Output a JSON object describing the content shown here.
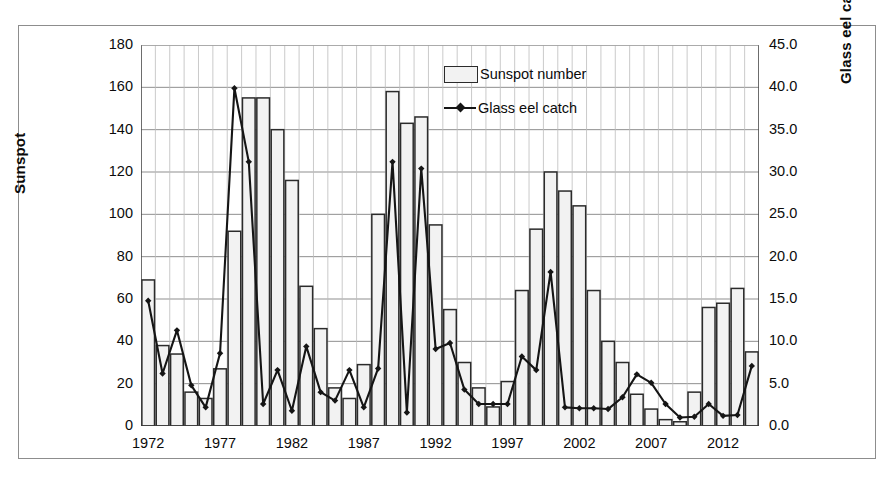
{
  "chart_data": {
    "type": "bar",
    "title": "",
    "subtitle": "",
    "xlabel": "",
    "ylabel": "Sunspot",
    "y2label": "Glass eel catch (tonnes)",
    "grid": true,
    "legend_position": "inside-top-center",
    "xlim": [
      1971.5,
      2014.5
    ],
    "ylim": [
      0,
      180
    ],
    "y2lim": [
      0,
      45
    ],
    "yticks": [
      0,
      20,
      40,
      60,
      80,
      100,
      120,
      140,
      160,
      180
    ],
    "y2ticks": [
      "0.0",
      "5.0",
      "10.0",
      "15.0",
      "20.0",
      "25.0",
      "30.0",
      "35.0",
      "40.0",
      "45.0"
    ],
    "xticks": [
      "1972",
      "1977",
      "1982",
      "1987",
      "1992",
      "1997",
      "2002",
      "2007",
      "2012"
    ],
    "xtick_values": [
      1972,
      1977,
      1982,
      1987,
      1992,
      1997,
      2002,
      2007,
      2012
    ],
    "x": [
      1972,
      1973,
      1974,
      1975,
      1976,
      1977,
      1978,
      1979,
      1980,
      1981,
      1982,
      1983,
      1984,
      1985,
      1986,
      1987,
      1988,
      1989,
      1990,
      1991,
      1992,
      1993,
      1994,
      1995,
      1996,
      1997,
      1998,
      1999,
      2000,
      2001,
      2002,
      2003,
      2004,
      2005,
      2006,
      2007,
      2008,
      2009,
      2010,
      2011,
      2012,
      2013,
      2014
    ],
    "series": [
      {
        "name": "Sunspot number",
        "type": "bar",
        "axis": "left",
        "units": "sunspot number",
        "color": "#f2f2f2",
        "edge_color": "#2b2b2b",
        "values": [
          69,
          38,
          34,
          16,
          13,
          27,
          92,
          155,
          155,
          140,
          116,
          66,
          46,
          18,
          13,
          29,
          100,
          158,
          143,
          146,
          95,
          55,
          30,
          18,
          9,
          21,
          64,
          93,
          120,
          111,
          104,
          64,
          40,
          30,
          15,
          8,
          3,
          2,
          16,
          56,
          58,
          65,
          35
        ]
      },
      {
        "name": "Glass eel catch",
        "type": "line",
        "axis": "right",
        "units": "tonnes",
        "color": "#151515",
        "marker": "diamond",
        "values": [
          14.8,
          6.2,
          11.3,
          4.8,
          2.2,
          8.6,
          39.9,
          31.2,
          2.6,
          6.6,
          1.8,
          9.4,
          4.0,
          3.0,
          6.6,
          2.2,
          6.8,
          31.2,
          1.6,
          30.4,
          9.1,
          9.8,
          4.3,
          2.6,
          2.6,
          2.6,
          8.2,
          6.6,
          18.2,
          2.2,
          2.1,
          2.1,
          2.0,
          3.4,
          6.1,
          5.1,
          2.6,
          1.0,
          1.1,
          2.6,
          1.2,
          1.3,
          7.1
        ]
      }
    ]
  },
  "figure": {
    "legend": {
      "items": [
        {
          "label": "Sunspot number",
          "marker": "bar-swatch"
        },
        {
          "label": "Glass eel catch",
          "marker": "line-diamond-swatch"
        }
      ]
    }
  }
}
